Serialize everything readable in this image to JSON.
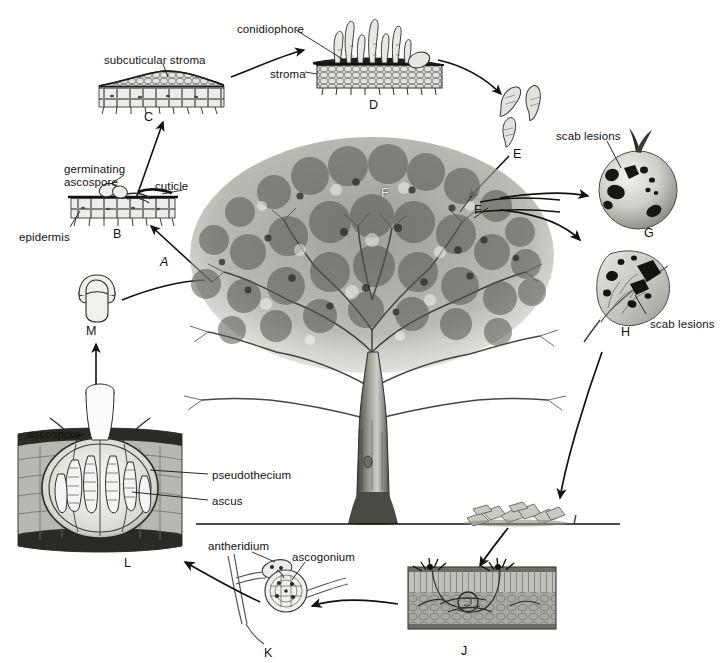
{
  "figure": {
    "background_color": "#ffffff",
    "ink_color": "#1a1a1a"
  },
  "terms": [
    {
      "id": "conidiophore",
      "text": "conidiophore",
      "x": 237,
      "y": 23,
      "lines": 1
    },
    {
      "id": "subcuticular-stroma",
      "text": "subcuticular stroma",
      "x": 104,
      "y": 54,
      "lines": 1
    },
    {
      "id": "stroma",
      "text": "stroma",
      "x": 270,
      "y": 68,
      "lines": 1
    },
    {
      "id": "scab-lesions-fruit",
      "text": "scab lesions",
      "x": 556,
      "y": 130,
      "lines": 1
    },
    {
      "id": "germinating",
      "text": "germinating",
      "x": 64,
      "y": 163,
      "lines": 1
    },
    {
      "id": "ascospore-germ",
      "text": "ascospore",
      "x": 64,
      "y": 175,
      "lines": 1
    },
    {
      "id": "cuticle",
      "text": "cuticle",
      "x": 155,
      "y": 180,
      "lines": 1
    },
    {
      "id": "epidermis",
      "text": "epidermis",
      "x": 19,
      "y": 231,
      "lines": 1
    },
    {
      "id": "scab-lesions-leaf",
      "text": "scab lesions",
      "x": 650,
      "y": 318,
      "lines": 1
    },
    {
      "id": "ascospore-left",
      "text": "ascospore",
      "x": 27,
      "y": 428,
      "lines": 1
    },
    {
      "id": "pseudothecium",
      "text": "pseudothecium",
      "x": 212,
      "y": 469,
      "lines": 1
    },
    {
      "id": "ascus",
      "text": "ascus",
      "x": 212,
      "y": 495,
      "lines": 1
    },
    {
      "id": "antheridium",
      "text": "antheridium",
      "x": 208,
      "y": 540,
      "lines": 1
    },
    {
      "id": "ascogonium",
      "text": "ascogonium",
      "x": 292,
      "y": 551,
      "lines": 1
    }
  ],
  "stage_letters": [
    {
      "id": "A",
      "text": "A",
      "x": 160,
      "y": 256,
      "italic": true
    },
    {
      "id": "B",
      "text": "B",
      "x": 113,
      "y": 228,
      "italic": false
    },
    {
      "id": "C",
      "text": "C",
      "x": 144,
      "y": 111,
      "italic": false
    },
    {
      "id": "D",
      "text": "D",
      "x": 369,
      "y": 99,
      "italic": false
    },
    {
      "id": "E",
      "text": "E",
      "x": 513,
      "y": 148,
      "italic": false
    },
    {
      "id": "F1",
      "text": "F",
      "x": 381,
      "y": 187,
      "italic": false
    },
    {
      "id": "F2",
      "text": "F",
      "x": 474,
      "y": 204,
      "italic": false
    },
    {
      "id": "G",
      "text": "G",
      "x": 644,
      "y": 227,
      "italic": false
    },
    {
      "id": "H",
      "text": "H",
      "x": 621,
      "y": 326,
      "italic": false
    },
    {
      "id": "I",
      "text": "I",
      "x": 573,
      "y": 514,
      "italic": true
    },
    {
      "id": "J",
      "text": "J",
      "x": 461,
      "y": 645,
      "italic": false
    },
    {
      "id": "K",
      "text": "K",
      "x": 264,
      "y": 647,
      "italic": false
    },
    {
      "id": "L",
      "text": "L",
      "x": 124,
      "y": 557,
      "italic": false
    },
    {
      "id": "M",
      "text": "M",
      "x": 86,
      "y": 325,
      "italic": false
    }
  ],
  "panels": [
    {
      "id": "panel-C",
      "name": "subcuticular-stroma-section",
      "letter": "C"
    },
    {
      "id": "panel-D",
      "name": "conidiophore-stroma-section",
      "letter": "D"
    },
    {
      "id": "panel-E",
      "name": "conidia-spores",
      "letter": "E"
    },
    {
      "id": "panel-B",
      "name": "germinating-ascospore-section",
      "letter": "B"
    },
    {
      "id": "panel-G",
      "name": "scabbed-apple-fruit",
      "letter": "G"
    },
    {
      "id": "panel-H",
      "name": "scabbed-apple-leaf",
      "letter": "H"
    },
    {
      "id": "panel-I",
      "name": "fallen-leaf-litter",
      "letter": "I"
    },
    {
      "id": "panel-J",
      "name": "overwintering-leaf-tissue",
      "letter": "J"
    },
    {
      "id": "panel-K",
      "name": "antheridium-ascogonium",
      "letter": "K"
    },
    {
      "id": "panel-L",
      "name": "pseudothecium-section",
      "letter": "L"
    },
    {
      "id": "panel-M",
      "name": "ascospore",
      "letter": "M"
    },
    {
      "id": "panel-F",
      "name": "apple-tree",
      "letter": "F"
    }
  ]
}
